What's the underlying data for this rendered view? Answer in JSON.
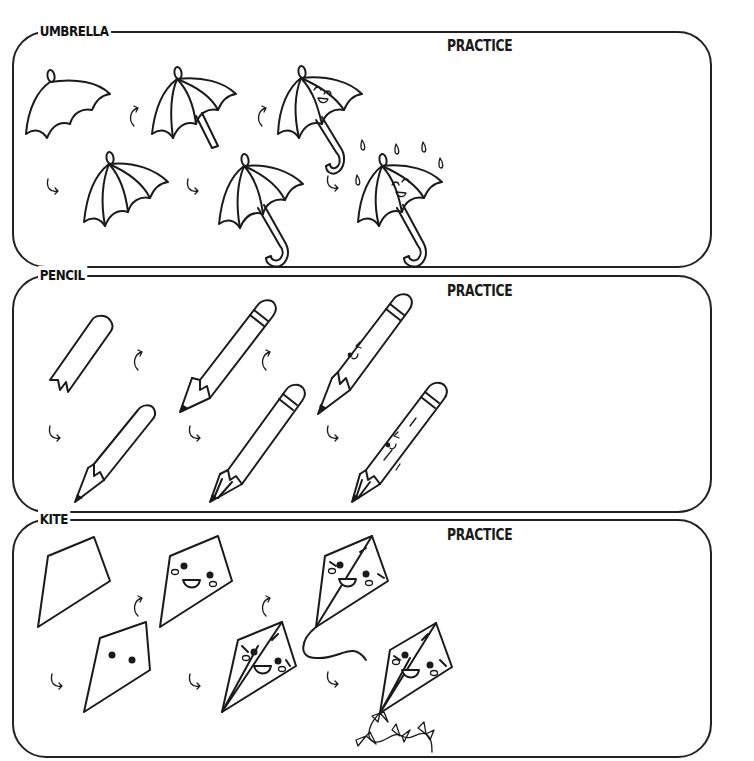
{
  "sections": [
    {
      "title": "UMBRELLA",
      "practice_label": "PRACTICE",
      "steps": 6
    },
    {
      "title": "PENCIL",
      "practice_label": "PRACTICE",
      "steps": 6
    },
    {
      "title": "KITE",
      "practice_label": "PRACTICE",
      "steps": 6
    }
  ],
  "colors": {
    "ink": "#1a1a1a",
    "background": "#ffffff"
  }
}
